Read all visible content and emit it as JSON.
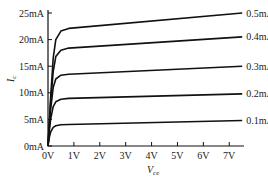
{
  "chart_data": {
    "type": "line",
    "title": "",
    "xlabel": "V_ce",
    "xlabel_main": "V",
    "xlabel_sub": "ce",
    "ylabel": "I_c",
    "ylabel_main": "I",
    "ylabel_sub": "c",
    "xlim": [
      0,
      7.5
    ],
    "ylim": [
      0,
      25
    ],
    "grid": false,
    "x_ticks": [
      0,
      1,
      2,
      3,
      4,
      5,
      6,
      7
    ],
    "x_tick_labels": [
      "0V",
      "1V",
      "2V",
      "3V",
      "4V",
      "5V",
      "6V",
      "7V"
    ],
    "y_ticks": [
      0,
      5,
      10,
      15,
      20,
      25
    ],
    "y_tick_labels": [
      "0mA",
      "5mA",
      "10mA",
      "15mA",
      "20mA",
      "25mA"
    ],
    "legend": "inline-right",
    "series": [
      {
        "name": "0.1mA",
        "x": [
          0,
          0.05,
          0.1,
          0.2,
          0.3,
          0.5,
          0.8,
          7.5
        ],
        "y": [
          0,
          1.6,
          2.6,
          3.5,
          3.8,
          4.0,
          4.05,
          4.8
        ]
      },
      {
        "name": "0.2mA",
        "x": [
          0,
          0.05,
          0.1,
          0.2,
          0.3,
          0.5,
          0.8,
          7.5
        ],
        "y": [
          0,
          2.8,
          5.0,
          7.4,
          8.3,
          8.8,
          8.95,
          9.8
        ]
      },
      {
        "name": "0.3mA",
        "x": [
          0,
          0.05,
          0.1,
          0.2,
          0.3,
          0.5,
          0.8,
          7.5
        ],
        "y": [
          0,
          3.5,
          6.8,
          11.0,
          12.6,
          13.3,
          13.5,
          15.0
        ]
      },
      {
        "name": "0.4mA",
        "x": [
          0,
          0.05,
          0.1,
          0.2,
          0.3,
          0.5,
          0.8,
          7.5
        ],
        "y": [
          0,
          4.0,
          8.0,
          14.0,
          16.8,
          18.0,
          18.4,
          20.5
        ]
      },
      {
        "name": "0.5mA",
        "x": [
          0,
          0.05,
          0.1,
          0.2,
          0.3,
          0.5,
          0.8,
          7.5
        ],
        "y": [
          0,
          4.5,
          9.0,
          16.5,
          20.0,
          21.6,
          22.1,
          25.0
        ]
      }
    ]
  }
}
